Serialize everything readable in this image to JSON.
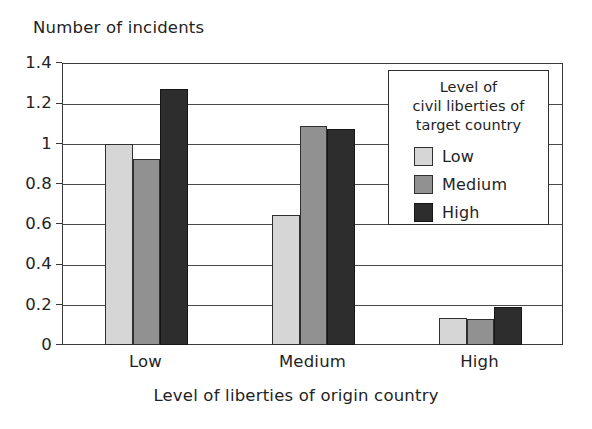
{
  "chart_data": {
    "type": "bar",
    "title": "",
    "ylabel": "Number of incidents",
    "xlabel": "Level of liberties of origin country",
    "categories": [
      "Low",
      "Medium",
      "High"
    ],
    "series": [
      {
        "name": "Low",
        "color": "#d6d6d6",
        "values": [
          1.0,
          0.647,
          0.135
        ]
      },
      {
        "name": "Medium",
        "color": "#919191",
        "values": [
          0.925,
          1.085,
          0.13
        ]
      },
      {
        "name": "High",
        "color": "#2d2d2d",
        "values": [
          1.27,
          1.07,
          0.19
        ]
      }
    ],
    "ylim": [
      0,
      1.4
    ],
    "yticks": [
      0,
      0.2,
      0.4,
      0.6,
      0.8,
      1,
      1.2,
      1.4
    ],
    "ytick_labels": [
      "0",
      "0.2",
      "0.4",
      "0.6",
      "0.8",
      "1",
      "1.2",
      "1.4"
    ],
    "grid": true,
    "legend_position": "top-right",
    "legend_title_lines": [
      "Level of",
      "civil liberties of",
      "target country"
    ]
  },
  "legend": {
    "title_line1": "Level of",
    "title_line2": "civil liberties of",
    "title_line3": "target country",
    "items": [
      {
        "label": "Low"
      },
      {
        "label": "Medium"
      },
      {
        "label": "High"
      }
    ]
  },
  "axes": {
    "y_title": "Number of incidents",
    "x_title": "Level of liberties of origin country"
  }
}
